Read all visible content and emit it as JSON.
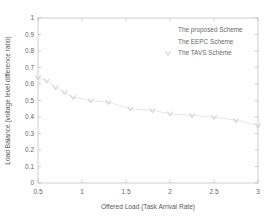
{
  "chart_data": {
    "type": "line",
    "title": "",
    "xlabel": "Offered Load (Task Arrival Rate)",
    "ylabel": "Load Balance (voltage level difference ratio)",
    "xlim": [
      0.5,
      3
    ],
    "ylim": [
      0,
      1
    ],
    "grid": false,
    "legend_position": "upper-right",
    "xticks": [
      "0.5",
      "1",
      "1.5",
      "2",
      "2.5",
      "3"
    ],
    "xtick_values": [
      0.5,
      1,
      1.5,
      2,
      2.5,
      3
    ],
    "yticks": [
      "0",
      "0.1",
      "0.2",
      "0.3",
      "0.4",
      "0.5",
      "0.6",
      "0.7",
      "0.8",
      "0.9",
      "1"
    ],
    "ytick_values": [
      0,
      0.1,
      0.2,
      0.3,
      0.4,
      0.5,
      0.6,
      0.7,
      0.8,
      0.9,
      1
    ],
    "legend": [
      "The proposed Scheme",
      "The EEPC Scheme",
      "The TAVS Scheme"
    ],
    "series": [
      {
        "name": "The proposed Scheme",
        "marker": "none",
        "color": "#d6d6d6",
        "x": [],
        "values": []
      },
      {
        "name": "The EEPC Scheme",
        "marker": "none",
        "color": "#d6d6d6",
        "x": [],
        "values": []
      },
      {
        "name": "The TAVS Scheme",
        "marker": "triangle-down",
        "color": "#bcbcbc",
        "x": [
          0.5,
          0.6,
          0.7,
          0.8,
          0.9,
          1.1,
          1.3,
          1.55,
          1.8,
          2.0,
          2.25,
          2.5,
          2.75,
          3.0
        ],
        "values": [
          0.64,
          0.62,
          0.58,
          0.55,
          0.52,
          0.5,
          0.49,
          0.45,
          0.44,
          0.42,
          0.41,
          0.4,
          0.38,
          0.35
        ]
      }
    ]
  }
}
